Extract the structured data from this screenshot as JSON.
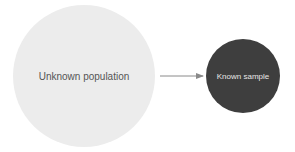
{
  "diagram": {
    "nodes": [
      {
        "id": "population",
        "label": "Unknown population",
        "fill": "#ececec",
        "text_color": "#555555"
      },
      {
        "id": "sample",
        "label": "Known sample",
        "fill": "#3e3e3e",
        "text_color": "#e6e6e6"
      }
    ],
    "edges": [
      {
        "from": "population",
        "to": "sample",
        "color": "#8a8a8a"
      }
    ]
  }
}
